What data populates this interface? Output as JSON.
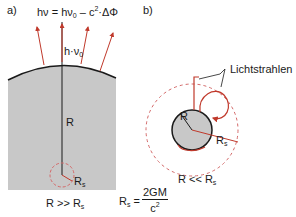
{
  "panel_a": {
    "label": "a)",
    "formula": {
      "lhs": "hν = hν",
      "lhs_sub": "0",
      "rhs_pre": " – c",
      "rhs_sup": "2",
      "rhs_post": "·ΔΦ"
    },
    "photon_label": "h·ν",
    "photon_label_sub": "0",
    "radius_label": "R",
    "rs_label": "R",
    "rs_label_sub": "s",
    "condition": "R >> R",
    "condition_sub": "s"
  },
  "panel_b": {
    "label": "b)",
    "rays_label": "Lichtstrahlen",
    "radius_label": "R",
    "rs_label": "R",
    "rs_label_sub": "s",
    "condition": "R << R",
    "condition_sub": "s"
  },
  "schwarzschild": {
    "lhs": "R",
    "lhs_sub": "s",
    "eq": " =",
    "numerator": "2GM",
    "denominator": "c",
    "denominator_sup": "2"
  },
  "colors": {
    "body_fill": "#c8c8c8",
    "outline": "#1a1a1a",
    "ray": "#c0392b",
    "dashed": "#d46a6a"
  }
}
